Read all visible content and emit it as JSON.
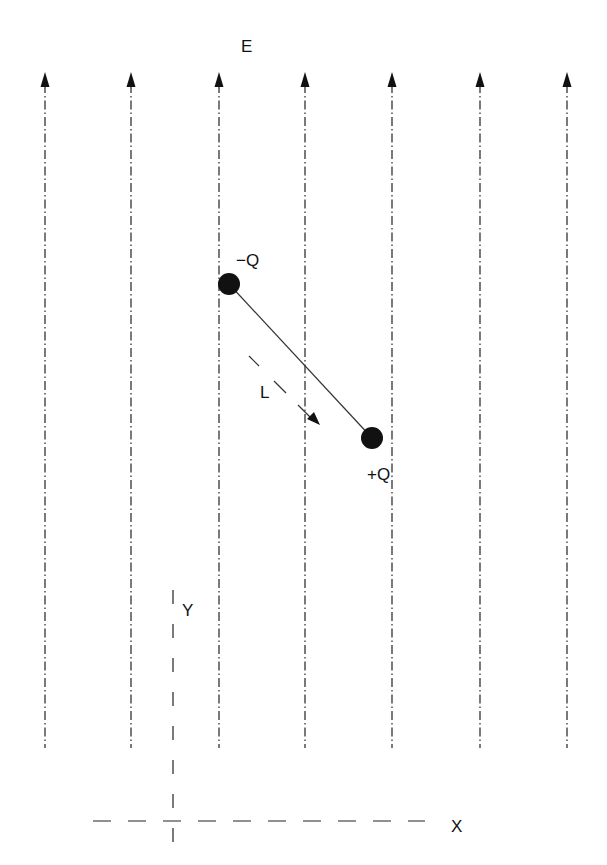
{
  "diagram": {
    "field_label": "E",
    "negative_charge_label": "−Q",
    "positive_charge_label": "+Q",
    "separation_label": "L",
    "y_axis_label": "Y",
    "x_axis_label": "X",
    "field_line_x": [
      45,
      131,
      219,
      305,
      392,
      480,
      567
    ],
    "field_line_top": 72,
    "field_line_bottom": 748,
    "negative_charge": {
      "x": 229,
      "y": 284,
      "r": 11
    },
    "positive_charge": {
      "x": 372,
      "y": 438,
      "r": 11
    },
    "ink_color": "#111111"
  }
}
